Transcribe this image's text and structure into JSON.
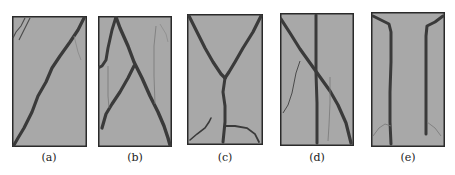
{
  "figure": {
    "background": "#ffffff",
    "panel_fill": "#a8a8a8",
    "panel_border": "#2a2a2a",
    "crack_color": "#3a3a3a",
    "thin_crack_color": "#6e6e6e",
    "panels": [
      {
        "id": "a",
        "label": "(a)",
        "description": "single diagonal crack from top-right to bottom-left"
      },
      {
        "id": "b",
        "label": "(b)",
        "description": "two crossing diagonal cracks forming inverted V / X"
      },
      {
        "id": "c",
        "label": "(c)",
        "description": "Y-shaped crack: two branches from top corners merging into vertical stem"
      },
      {
        "id": "d",
        "label": "(d)",
        "description": "vertical crack crossed by diagonal crack"
      },
      {
        "id": "e",
        "label": "(e)",
        "description": "two parallel vertical cracks flaring to top corners"
      }
    ]
  }
}
